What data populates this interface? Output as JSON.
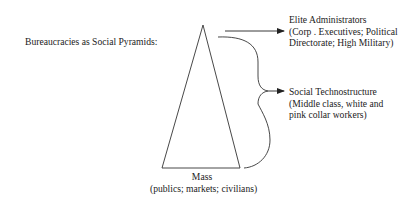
{
  "diagram": {
    "title": "Bureaucracies as Social Pyramids:",
    "levels": [
      {
        "id": "elite",
        "lines": [
          "Elite Administrators",
          "(Corp . Executives; Political",
          "Directorate; High Military)"
        ]
      },
      {
        "id": "techno",
        "lines": [
          "Social Technostructure",
          "(Middle class, white and",
          "pink collar workers)"
        ]
      },
      {
        "id": "mass",
        "lines": [
          "Mass",
          "(publics; markets; civilians)"
        ]
      }
    ],
    "colors": {
      "line": "#333333",
      "text": "#222222",
      "background": "#ffffff"
    }
  }
}
